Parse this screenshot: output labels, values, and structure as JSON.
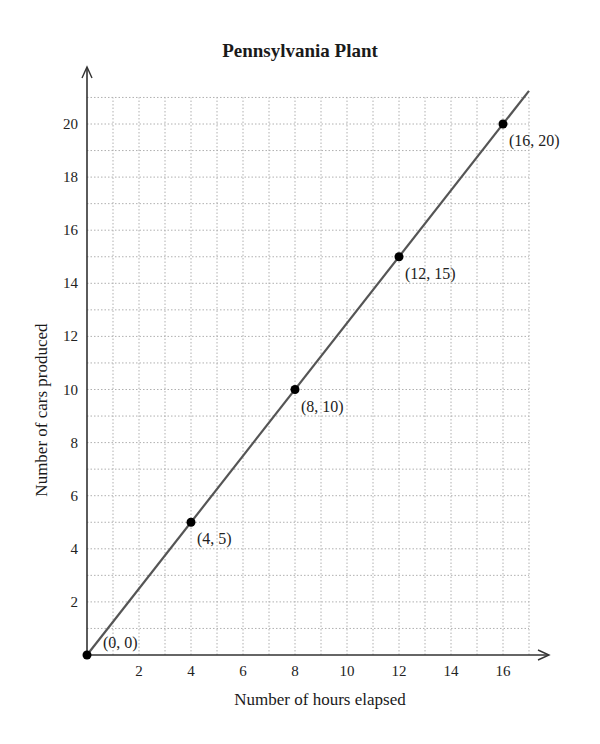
{
  "chart_data": {
    "type": "line",
    "title": "Pennsylvania Plant",
    "xlabel": "Number of hours elapsed",
    "ylabel": "Number of cars produced",
    "x": [
      0,
      4,
      8,
      12,
      16
    ],
    "series": [
      {
        "name": "Pennsylvania Plant",
        "values": [
          0,
          5,
          10,
          15,
          20
        ]
      }
    ],
    "point_labels": [
      "(0, 0)",
      "(4, 5)",
      "(8, 10)",
      "(12, 15)",
      "(16, 20)"
    ],
    "xlim": [
      0,
      17
    ],
    "ylim": [
      0,
      21
    ],
    "x_ticks": [
      2,
      4,
      6,
      8,
      10,
      12,
      14,
      16
    ],
    "y_ticks": [
      2,
      4,
      6,
      8,
      10,
      12,
      14,
      16,
      18,
      20
    ],
    "grid": true,
    "grid_style": "dotted",
    "line_extends_to": [
      17,
      21.25
    ],
    "colors": {
      "line": "#555555",
      "point": "#000000",
      "grid": "#b0b0b0",
      "axis": "#333333"
    }
  }
}
